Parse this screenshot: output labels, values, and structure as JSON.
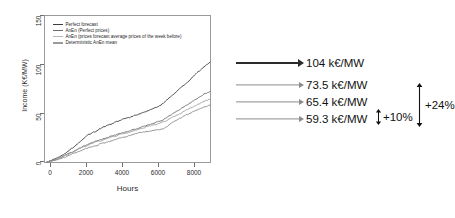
{
  "chart_data": {
    "type": "line",
    "title": "",
    "xlabel": "Hours",
    "ylabel": "Income (K€/MW)",
    "xlim": [
      0,
      8760
    ],
    "ylim": [
      0,
      150
    ],
    "xticks": [
      0,
      2000,
      4000,
      6000,
      8000
    ],
    "yticks": [
      0,
      50,
      100,
      150
    ],
    "grid": false,
    "legend_position": "top-left-inside",
    "series": [
      {
        "name": "Perfect forecast",
        "color": "#3d3d3d",
        "final_value": 104,
        "x": [
          0,
          250,
          500,
          750,
          1000,
          1250,
          1500,
          1750,
          2000,
          2250,
          2500,
          2750,
          3000,
          3250,
          3500,
          3750,
          4000,
          4250,
          4500,
          4750,
          5000,
          5250,
          5500,
          5750,
          6000,
          6250,
          6500,
          6750,
          7000,
          7250,
          7500,
          7750,
          8000,
          8250,
          8500,
          8760
        ],
        "values": [
          0,
          2,
          4,
          6.5,
          9,
          13,
          17,
          21,
          25,
          28.5,
          31,
          33.5,
          36,
          38,
          40,
          42,
          44,
          45.5,
          47,
          48.5,
          50,
          52,
          54,
          56.5,
          58,
          61,
          66,
          70,
          74,
          78,
          82,
          87,
          92,
          96,
          100,
          104
        ]
      },
      {
        "name": "AnEn (Perfect prices)",
        "color": "#6e6e6e",
        "final_value": 73.5,
        "x": [
          0,
          250,
          500,
          750,
          1000,
          1250,
          1500,
          1750,
          2000,
          2250,
          2500,
          2750,
          3000,
          3250,
          3500,
          3750,
          4000,
          4250,
          4500,
          4750,
          5000,
          5250,
          5500,
          5750,
          6000,
          6250,
          6500,
          6750,
          7000,
          7250,
          7500,
          7750,
          8000,
          8250,
          8500,
          8760
        ],
        "values": [
          0,
          1.5,
          3,
          5,
          7,
          9.5,
          12,
          14.5,
          17,
          19,
          21,
          22.5,
          24,
          25.5,
          27,
          28.5,
          30,
          31.5,
          33,
          34.5,
          36,
          37.5,
          39,
          40.5,
          42,
          44,
          47,
          50,
          53,
          56,
          59,
          62,
          65,
          68,
          71,
          73.5
        ]
      },
      {
        "name": "AnEn (prices forecast average prices of the week before)",
        "color": "#9d9d9d",
        "final_value": 65.4,
        "x": [
          0,
          250,
          500,
          750,
          1000,
          1250,
          1500,
          1750,
          2000,
          2250,
          2500,
          2750,
          3000,
          3250,
          3500,
          3750,
          4000,
          4250,
          4500,
          4750,
          5000,
          5250,
          5500,
          5750,
          6000,
          6250,
          6500,
          6750,
          7000,
          7250,
          7500,
          7750,
          8000,
          8250,
          8500,
          8760
        ],
        "values": [
          0,
          1.4,
          2.8,
          4.6,
          6.5,
          9,
          11.5,
          14,
          16,
          18,
          20,
          21.5,
          23,
          24.5,
          26,
          27.5,
          29,
          30,
          31.5,
          33,
          34.5,
          36,
          37.5,
          38.5,
          40,
          41.5,
          44,
          46.5,
          49,
          51.5,
          54,
          56.5,
          59,
          61.5,
          63.5,
          65.4
        ]
      },
      {
        "name": "Deterministic AnEn mean",
        "color": "#8a8a8a",
        "final_value": 59.3,
        "x": [
          0,
          250,
          500,
          750,
          1000,
          1250,
          1500,
          1750,
          2000,
          2250,
          2500,
          2750,
          3000,
          3250,
          3500,
          3750,
          4000,
          4250,
          4500,
          4750,
          5000,
          5250,
          5500,
          5750,
          6000,
          6250,
          6500,
          6750,
          7000,
          7250,
          7500,
          7750,
          8000,
          8250,
          8500,
          8760
        ],
        "values": [
          0,
          1.2,
          2.5,
          4,
          5.5,
          7.5,
          9.5,
          11.5,
          13.5,
          15,
          16.5,
          18,
          19.5,
          21,
          22.5,
          24,
          25.5,
          26.5,
          28,
          29,
          30.5,
          31.5,
          32.5,
          33,
          34,
          34.5,
          38,
          41,
          44,
          46.5,
          49,
          51.5,
          53.5,
          55.5,
          57.5,
          59.3
        ]
      }
    ],
    "annotations": [
      {
        "label": "104  k€/MW",
        "value": 104,
        "color": "#2b2b2b"
      },
      {
        "label": "73.5 k€/MW",
        "value": 73.5,
        "color": "#8c8c8c"
      },
      {
        "label": "65.4 k€/MW",
        "value": 65.4,
        "color": "#8c8c8c"
      },
      {
        "label": "59.3 k€/MW",
        "value": 59.3,
        "color": "#8c8c8c"
      }
    ],
    "brackets": [
      {
        "label": "+10%",
        "between": [
          "65.4 k€/MW",
          "59.3 k€/MW"
        ]
      },
      {
        "label": "+24%",
        "between": [
          "73.5 k€/MW",
          "59.3 k€/MW"
        ]
      }
    ]
  }
}
